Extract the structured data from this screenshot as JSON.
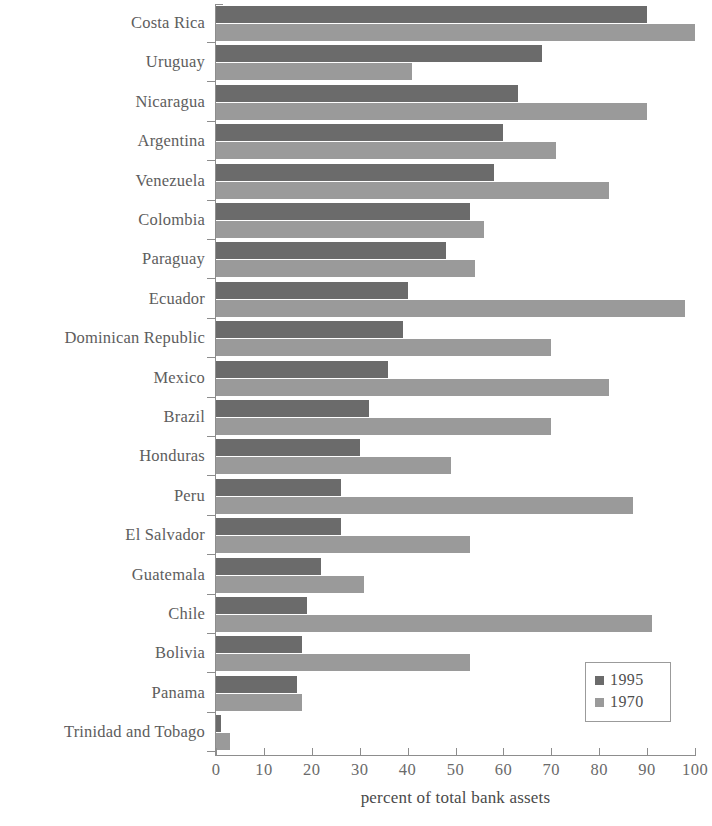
{
  "chart_data": {
    "type": "bar",
    "orientation": "horizontal",
    "title": "",
    "xlabel": "percent of total bank assets",
    "ylabel": "",
    "xlim": [
      0,
      100
    ],
    "xticks": [
      0,
      10,
      20,
      30,
      40,
      50,
      60,
      70,
      80,
      90,
      100
    ],
    "grid": false,
    "legend_position": "bottom-right",
    "categories": [
      "Costa Rica",
      "Uruguay",
      "Nicaragua",
      "Argentina",
      "Venezuela",
      "Colombia",
      "Paraguay",
      "Ecuador",
      "Dominican Republic",
      "Mexico",
      "Brazil",
      "Honduras",
      "Peru",
      "El Salvador",
      "Guatemala",
      "Chile",
      "Bolivia",
      "Panama",
      "Trinidad and Tobago"
    ],
    "series": [
      {
        "name": "1995",
        "color": "#6b6b6b",
        "values": [
          90,
          68,
          63,
          60,
          58,
          53,
          48,
          40,
          39,
          36,
          32,
          30,
          26,
          26,
          22,
          19,
          18,
          17,
          1
        ]
      },
      {
        "name": "1970",
        "color": "#9a9a9a",
        "values": [
          100,
          41,
          90,
          71,
          82,
          56,
          54,
          98,
          70,
          82,
          70,
          49,
          87,
          53,
          31,
          91,
          53,
          18,
          3
        ]
      }
    ]
  },
  "axis": {
    "x_title": "percent of total bank assets",
    "tick_labels": [
      "0",
      "10",
      "20",
      "30",
      "40",
      "50",
      "60",
      "70",
      "80",
      "90",
      "100"
    ]
  },
  "legend": {
    "entries": [
      {
        "label": "1995",
        "color": "#6b6b6b"
      },
      {
        "label": "1970",
        "color": "#9a9a9a"
      }
    ]
  },
  "colors": {
    "bar_1995": "#6b6b6b",
    "bar_1970": "#9a9a9a",
    "axis": "#8d8d8d",
    "text": "#5d5d5d",
    "background": "#ffffff"
  }
}
